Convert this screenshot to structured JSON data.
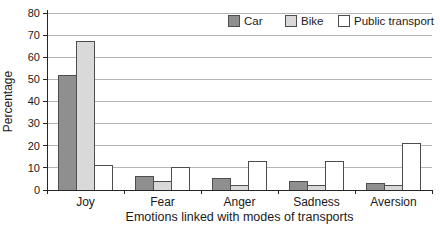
{
  "chart_data": {
    "type": "bar",
    "title": "",
    "categories": [
      "Joy",
      "Fear",
      "Anger",
      "Sadness",
      "Aversion"
    ],
    "series": [
      {
        "name": "Car",
        "color": "#8f8f8f",
        "values": [
          52,
          6,
          5,
          4,
          3
        ]
      },
      {
        "name": "Bike",
        "color": "#d9d9d9",
        "values": [
          67,
          4,
          2,
          2,
          2
        ]
      },
      {
        "name": "Public transport",
        "color": "#ffffff",
        "values": [
          11,
          10,
          13,
          13,
          21
        ]
      }
    ],
    "xlabel": "Emotions linked with modes of transports",
    "ylabel": "Percentage",
    "ylim": [
      0,
      80
    ],
    "ytick_step": 10,
    "yticks": [
      0,
      10,
      20,
      30,
      40,
      50,
      60,
      70,
      80
    ],
    "grid": true,
    "legend_position": "top-right",
    "legend_labels": [
      "Car",
      "Bike",
      "Public transport"
    ],
    "colors": {
      "bar_edge": "#4d4d4d",
      "grid": "#b5b5b5",
      "axis": "#262626",
      "text": "#1a1a1a",
      "background": "#ffffff"
    }
  }
}
